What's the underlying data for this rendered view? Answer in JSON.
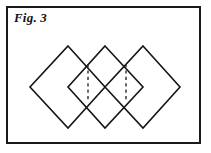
{
  "figure": {
    "label": "Fig. 3",
    "frame": {
      "x": 6,
      "y": 6,
      "width": 195,
      "height": 138,
      "border_color": "#1a1a1a",
      "border_width": 2,
      "background": "#ffffff"
    },
    "stroke_color": "#151515",
    "dash_color": "#2b2b2b",
    "shapes": [
      {
        "name": "diamond-1",
        "top": [
          68,
          46
        ],
        "right": [
          105,
          87
        ],
        "bottom": [
          68,
          128
        ],
        "left": [
          30,
          87
        ]
      },
      {
        "name": "diamond-2",
        "top": [
          105,
          46
        ],
        "right": [
          143,
          87
        ],
        "bottom": [
          105,
          128
        ],
        "left": [
          68,
          87
        ]
      },
      {
        "name": "diamond-3",
        "top": [
          143,
          46
        ],
        "right": [
          180,
          87
        ],
        "bottom": [
          143,
          128
        ],
        "left": [
          105,
          87
        ]
      }
    ],
    "seams": [
      {
        "name": "seam-1",
        "x": 88,
        "y_top": 64,
        "y_bottom": 102
      },
      {
        "name": "seam-2",
        "x": 126,
        "y_top": 64,
        "y_bottom": 102
      }
    ]
  }
}
